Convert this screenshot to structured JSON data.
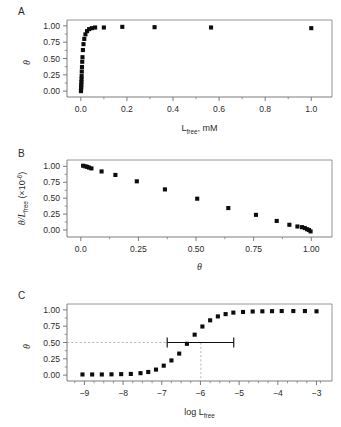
{
  "figure": {
    "panels": [
      {
        "letter": "A"
      },
      {
        "letter": "B"
      },
      {
        "letter": "C"
      }
    ]
  },
  "chart_data": [
    {
      "type": "scatter",
      "panel": "A",
      "title": "",
      "xlabel": "L_free, mM",
      "xlabel_base": "L",
      "xlabel_sub": "free",
      "xlabel_tail": ", mM",
      "ylabel": "θ",
      "xlim": [
        -0.06,
        1.09
      ],
      "ylim": [
        -0.09,
        1.09
      ],
      "xticks": [
        0.0,
        0.2,
        0.4,
        0.6,
        0.8,
        1.0
      ],
      "xticklabels": [
        "0.0",
        "0.2",
        "0.4",
        "0.6",
        "0.8",
        "1.0"
      ],
      "yticks": [
        0.0,
        0.25,
        0.5,
        0.75,
        1.0
      ],
      "yticklabels": [
        "0.00",
        "0.25",
        "0.50",
        "0.75",
        "1.00"
      ],
      "x_minor_ticks": [
        0.1,
        0.3,
        0.5,
        0.7,
        0.9
      ],
      "y_minor_ticks": [
        0.125,
        0.375,
        0.625,
        0.875
      ],
      "grid": false,
      "legend": "none",
      "marker": "filled-square",
      "x": [
        0.0005,
        0.0008,
        0.0012,
        0.0016,
        0.002,
        0.0025,
        0.003,
        0.0035,
        0.0042,
        0.005,
        0.006,
        0.0072,
        0.009,
        0.0115,
        0.015,
        0.02,
        0.027,
        0.036,
        0.048,
        0.062,
        0.1,
        0.18,
        0.32,
        0.565,
        1.0
      ],
      "y": [
        0.0,
        0.02,
        0.04,
        0.07,
        0.1,
        0.14,
        0.18,
        0.23,
        0.3,
        0.37,
        0.45,
        0.52,
        0.63,
        0.72,
        0.8,
        0.87,
        0.92,
        0.95,
        0.965,
        0.975,
        0.975,
        0.985,
        0.98,
        0.975,
        0.965
      ]
    },
    {
      "type": "scatter",
      "panel": "B",
      "title": "",
      "xlabel": "θ",
      "ylabel": "θ/L_free (×10⁻⁶)",
      "ylabel_base": "θ/L",
      "ylabel_sub": "free",
      "ylabel_tail": " (×10",
      "ylabel_sup": "-6",
      "ylabel_close": ")",
      "xlim": [
        -0.06,
        1.09
      ],
      "ylim": [
        -0.11,
        1.1
      ],
      "xticks": [
        0.0,
        0.25,
        0.5,
        0.75,
        1.0
      ],
      "xticklabels": [
        "0.0",
        "0.25",
        "0.50",
        "0.75",
        "1.00"
      ],
      "yticks": [
        0.0,
        0.25,
        0.5,
        0.75,
        1.0
      ],
      "yticklabels": [
        "0.00",
        "0.25",
        "0.50",
        "0.75",
        "1.00"
      ],
      "x_minor_ticks": [
        0.125,
        0.375,
        0.625,
        0.875
      ],
      "y_minor_ticks": [
        0.125,
        0.375,
        0.625,
        0.875
      ],
      "grid": false,
      "legend": "none",
      "marker": "filled-square",
      "x": [
        0.01,
        0.02,
        0.028,
        0.036,
        0.046,
        0.09,
        0.15,
        0.243,
        0.365,
        0.505,
        0.64,
        0.76,
        0.85,
        0.905,
        0.94,
        0.96,
        0.972,
        0.982,
        0.99,
        0.997
      ],
      "y": [
        1.01,
        1.0,
        0.992,
        0.98,
        0.968,
        0.92,
        0.865,
        0.765,
        0.638,
        0.492,
        0.345,
        0.238,
        0.142,
        0.082,
        0.055,
        0.045,
        0.03,
        0.012,
        0.0,
        -0.022
      ]
    },
    {
      "type": "scatter",
      "panel": "C",
      "title": "",
      "xlabel": "log L_free",
      "xlabel_base": "log L",
      "xlabel_sub": "free",
      "ylabel": "θ",
      "xlim": [
        -9.45,
        -2.6
      ],
      "ylim": [
        -0.09,
        1.09
      ],
      "xticks": [
        -9,
        -8,
        -7,
        -6,
        -5,
        -4,
        -3
      ],
      "xticklabels": [
        "−9",
        "−8",
        "−7",
        "−6",
        "−5",
        "−4",
        "−3"
      ],
      "yticks": [
        0.0,
        0.25,
        0.5,
        0.75,
        1.0
      ],
      "yticklabels": [
        "0.00",
        "0.25",
        "0.50",
        "0.75",
        "1.00"
      ],
      "x_minor_ticks": [
        -9.25,
        -8.75,
        -8.5,
        -8.25,
        -7.75,
        -7.5,
        -7.25,
        -6.75,
        -6.5,
        -6.25,
        -5.75,
        -5.5,
        -5.25,
        -4.75,
        -4.5,
        -4.25,
        -3.75,
        -3.5,
        -3.25,
        -2.9
      ],
      "y_minor_ticks": [
        0.125,
        0.375,
        0.625,
        0.875
      ],
      "grid": false,
      "legend": "none",
      "marker": "filled-square",
      "x": [
        -9.05,
        -8.8,
        -8.55,
        -8.3,
        -8.05,
        -7.8,
        -7.55,
        -7.35,
        -7.15,
        -6.95,
        -6.75,
        -6.55,
        -6.35,
        -6.15,
        -5.95,
        -5.75,
        -5.55,
        -5.35,
        -5.15,
        -4.9,
        -4.65,
        -4.4,
        -4.15,
        -3.9,
        -3.6,
        -3.3,
        -3.0
      ],
      "y": [
        0.01,
        0.01,
        0.01,
        0.012,
        0.015,
        0.018,
        0.03,
        0.048,
        0.085,
        0.145,
        0.225,
        0.33,
        0.48,
        0.62,
        0.745,
        0.84,
        0.9,
        0.935,
        0.958,
        0.968,
        0.975,
        0.978,
        0.98,
        0.982,
        0.982,
        0.982,
        0.978
      ],
      "annotations": [
        {
          "name": "midpoint-error-bar",
          "type": "horizontal-error-bar",
          "x": -5.99,
          "y": 0.5,
          "x_low": -6.86,
          "x_high": -5.14
        },
        {
          "name": "horizontal-guide",
          "type": "dashed-line",
          "y": 0.5,
          "from_x": -9.45,
          "to_x": -5.99
        },
        {
          "name": "vertical-guide",
          "type": "dashed-line",
          "x": -5.99,
          "from_y": -0.09,
          "to_y": 0.5
        }
      ]
    }
  ],
  "colors": {
    "marker": "#0d0d0d",
    "axis": "#6e6e6e",
    "frame": "#8a8a8a",
    "guide": "#a8a8a8",
    "text": "#2b2b2b",
    "background": "#ffffff"
  }
}
